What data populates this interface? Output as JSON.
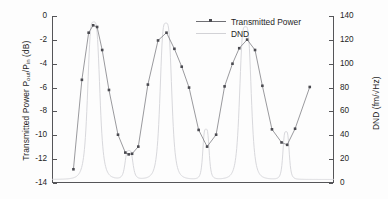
{
  "chart_data": {
    "type": "line",
    "title": "",
    "xlabel": "",
    "ylabel": "Transmitted Power P out /P in  (dB)",
    "ylabel_main": "Transmitted Power P",
    "ylabel_sub1": "out",
    "ylabel_mid": "/P",
    "ylabel_sub2": "in",
    "ylabel_tail": " (dB)",
    "y2label": "DND (fm/√Hz)",
    "y2label_main": "DND (fm/",
    "y2label_radic": "√",
    "y2label_tail": "Hz)",
    "ylim": [
      -14,
      0
    ],
    "y2lim": [
      0,
      140
    ],
    "xlim": [
      0,
      100
    ],
    "yticks": [
      0,
      -2,
      -4,
      -6,
      -8,
      -10,
      -12,
      -14
    ],
    "ytick_labels": [
      "0",
      "-2",
      "-4",
      "-6",
      "-8",
      "-10",
      "-12",
      "-14"
    ],
    "y2ticks": [
      140,
      120,
      100,
      80,
      60,
      40,
      20,
      0
    ],
    "y2tick_labels": [
      "140",
      "120",
      "100",
      "80",
      "60",
      "40",
      "20",
      "0"
    ],
    "xticks": [],
    "xtick_labels": [],
    "grid": false,
    "legend_position": "top-right",
    "series": [
      {
        "name": "Transmitted Power",
        "axis": "left",
        "marker": "square",
        "color": "#6f6f74",
        "marker_color": "#4a4a50",
        "points": [
          [
            7.6,
            -12.85
          ],
          [
            10.6,
            -5.35
          ],
          [
            13.0,
            -1.4
          ],
          [
            14.6,
            -0.78
          ],
          [
            16.0,
            -0.92
          ],
          [
            17.8,
            -2.85
          ],
          [
            20.2,
            -6.2
          ],
          [
            23.4,
            -9.95
          ],
          [
            26.0,
            -11.45
          ],
          [
            27.2,
            -11.6
          ],
          [
            28.4,
            -11.55
          ],
          [
            30.6,
            -10.95
          ],
          [
            34.0,
            -5.75
          ],
          [
            37.6,
            -2.05
          ],
          [
            40.6,
            -1.4
          ],
          [
            43.4,
            -2.75
          ],
          [
            46.0,
            -4.25
          ],
          [
            48.6,
            -6.0
          ],
          [
            52.0,
            -9.55
          ],
          [
            55.0,
            -10.95
          ],
          [
            58.2,
            -9.95
          ],
          [
            61.2,
            -5.9
          ],
          [
            64.0,
            -4.0
          ],
          [
            66.4,
            -2.7
          ],
          [
            69.2,
            -1.98
          ],
          [
            72.0,
            -2.85
          ],
          [
            74.6,
            -5.85
          ],
          [
            78.0,
            -9.5
          ],
          [
            81.4,
            -10.6
          ],
          [
            83.4,
            -10.8
          ],
          [
            86.2,
            -9.45
          ],
          [
            91.4,
            -5.95
          ]
        ]
      },
      {
        "name": "DND",
        "axis": "right",
        "marker": "none",
        "color": "#d8d8dc",
        "peaks": [
          {
            "center": 14.8,
            "height": 132,
            "width": 2.3
          },
          {
            "center": 27.3,
            "height": 24,
            "width": 1.5
          },
          {
            "center": 40.4,
            "height": 131,
            "width": 2.2
          },
          {
            "center": 54.6,
            "height": 42,
            "width": 1.2
          },
          {
            "center": 68.6,
            "height": 128,
            "width": 2.2
          },
          {
            "center": 83.0,
            "height": 40,
            "width": 1.2
          }
        ],
        "baseline": 3
      }
    ]
  },
  "legend": {
    "items": [
      {
        "label": "Transmitted Power",
        "style": "line-marker"
      },
      {
        "label": "DND",
        "style": "line"
      }
    ]
  },
  "colors": {
    "axis": "#555558",
    "transmitted_power": "#6f6f74",
    "transmitted_power_marker": "#4a4a50",
    "dnd": "#d8d8dc",
    "text": "#1f1f1f",
    "background": "#fdfdfd"
  }
}
